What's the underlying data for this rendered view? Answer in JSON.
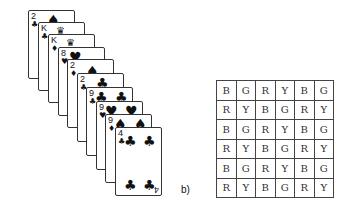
{
  "figure": {
    "panel_label": "b)",
    "cards": [
      {
        "rank": "2",
        "suit": "♣",
        "pip": "♠"
      },
      {
        "rank": "K",
        "suit": "♣",
        "pip": "♛"
      },
      {
        "rank": "K",
        "suit": "♦",
        "pip": "♛"
      },
      {
        "rank": "8",
        "suit": "♥",
        "pip": "♥"
      },
      {
        "rank": "2",
        "suit": "♦",
        "pip": "♠"
      },
      {
        "rank": "2",
        "suit": "♣",
        "pip": "♣"
      },
      {
        "rank": "9",
        "suit": "♣",
        "pip": "♣"
      },
      {
        "rank": "9",
        "suit": "♥",
        "pip": "♥"
      },
      {
        "rank": "9",
        "suit": "♦",
        "pip": "♠"
      },
      {
        "rank": "4",
        "suit": "♣",
        "pip": "♣",
        "bottom_rank": "4"
      }
    ],
    "grid": {
      "rows": [
        [
          "B",
          "G",
          "R",
          "Y",
          "B",
          "G"
        ],
        [
          "R",
          "Y",
          "B",
          "G",
          "R",
          "Y"
        ],
        [
          "B",
          "G",
          "R",
          "Y",
          "B",
          "G"
        ],
        [
          "R",
          "Y",
          "B",
          "G",
          "R",
          "Y"
        ],
        [
          "B",
          "G",
          "R",
          "Y",
          "B",
          "G"
        ],
        [
          "R",
          "Y",
          "B",
          "G",
          "R",
          "Y"
        ]
      ]
    }
  }
}
